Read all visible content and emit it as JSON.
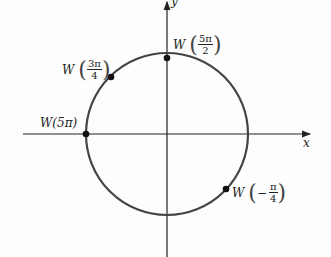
{
  "diagram": {
    "type": "unit-circle",
    "axes": {
      "x_label": "x",
      "y_label": "y"
    },
    "circle": {
      "center": [
        167,
        134
      ],
      "radius": 81,
      "color": "#444444"
    },
    "points": [
      {
        "id": "w-5pi-over-2",
        "func": "W",
        "arg_num": "5π",
        "arg_den": "2",
        "arg_sign": "",
        "pos": [
          167,
          58
        ]
      },
      {
        "id": "w-3pi-over-4",
        "func": "W",
        "arg_num": "3π",
        "arg_den": "4",
        "arg_sign": "",
        "pos": [
          111,
          77
        ]
      },
      {
        "id": "w-5pi",
        "func": "W",
        "arg": "(5π)",
        "pos": [
          86,
          134
        ]
      },
      {
        "id": "w-neg-pi-over-4",
        "func": "W",
        "arg_num": "π",
        "arg_den": "4",
        "arg_sign": "−",
        "pos": [
          226,
          189
        ]
      }
    ]
  }
}
